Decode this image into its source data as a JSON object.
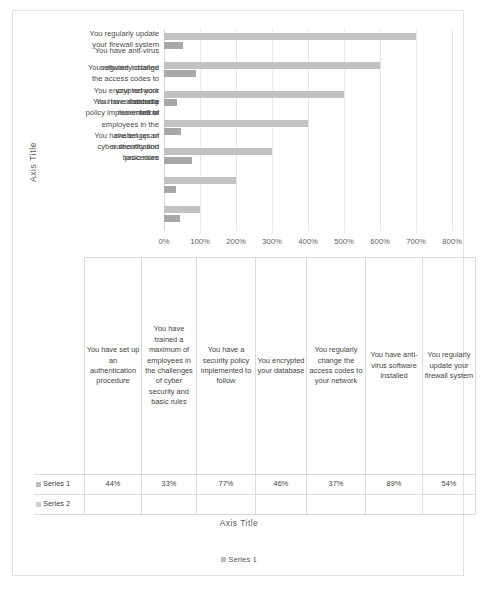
{
  "chart_data": {
    "type": "bar",
    "title": "",
    "orientation": "horizontal",
    "xlabel": "Axis Title",
    "ylabel": "Axis Title",
    "xlim": [
      0,
      800
    ],
    "xunit": "%",
    "grid": true,
    "legend_position": "bottom",
    "legend_entries": [
      "Series 1"
    ],
    "xticks": [
      "0%",
      "100%",
      "200%",
      "300%",
      "400%",
      "500%",
      "600%",
      "700%",
      "800%"
    ],
    "xtick_values": [
      0,
      100,
      200,
      300,
      400,
      500,
      600,
      700,
      800
    ],
    "categories": [
      "You have set up an authentication procedure",
      "You have trained a maximum of employees in the challenges of cyber security and basic rules",
      "You have a security policy implemented to follow",
      "You encrypted your database",
      "You regularly change the access codes to your network",
      "You have anti-virus software installed",
      "You regularly update your firewall system"
    ],
    "series": [
      {
        "name": "Series 1",
        "color": "#c2c2c2",
        "values": [
          100,
          200,
          300,
          400,
          500,
          600,
          700
        ]
      },
      {
        "name": "Series 2",
        "color": "#a8a8a8",
        "values": [
          44,
          33,
          77,
          46,
          37,
          89,
          54
        ]
      }
    ],
    "plot_order_top_to_bottom": [
      "You regularly update your firewall system",
      "You have anti-virus software installed",
      "You regularly change the access codes to your network",
      "You encrypted your database",
      "You have a security policy implemented to follow",
      "You have trained a maximum of employees in the challenges of cyber security and basic rules",
      "You have set up an authentication procedure"
    ],
    "colors": {
      "series1": "#c2c2c2",
      "series2": "#a8a8a8",
      "gridline": "#e8e8e8",
      "border": "#e2e2e2",
      "text": "#3f3f3f"
    }
  },
  "axis_titles": {
    "vertical": "Axis Title",
    "horizontal": "Axis Title"
  },
  "category_labels_rendered": [
    {
      "text": "You regularly update",
      "top": 0,
      "cls": ""
    },
    {
      "text": "your firewall system",
      "top": 11,
      "cls": ""
    },
    {
      "text": "You have anti-virus",
      "top": 17,
      "cls": ""
    },
    {
      "text": "You regularly change",
      "top": 34,
      "cls": ""
    },
    {
      "text": "software installed",
      "top": 34,
      "cls": ""
    },
    {
      "text": "the access codes to",
      "top": 45,
      "cls": ""
    },
    {
      "text": "your network",
      "top": 57,
      "cls": ""
    },
    {
      "text": "You encrypted your",
      "top": 57,
      "cls": ""
    },
    {
      "text": "database",
      "top": 68,
      "cls": ""
    },
    {
      "text": "You have a security",
      "top": 68,
      "cls": ""
    },
    {
      "text": "policy implemented to",
      "top": 79,
      "cls": ""
    },
    {
      "text": "follow",
      "top": 79,
      "cls": ""
    },
    {
      "text": "You have trained a",
      "top": 68,
      "cls": ""
    },
    {
      "text": "maximum of",
      "top": 79,
      "cls": ""
    },
    {
      "text": "employees in the",
      "top": 91,
      "cls": ""
    },
    {
      "text": "challenges of",
      "top": 102,
      "cls": ""
    },
    {
      "text": "cyber security and",
      "top": 113,
      "cls": ""
    },
    {
      "text": "basic rules",
      "top": 124,
      "cls": ""
    },
    {
      "text": "You have set up an",
      "top": 102,
      "cls": ""
    },
    {
      "text": "authentication",
      "top": 113,
      "cls": ""
    },
    {
      "text": "procedure",
      "top": 124,
      "cls": ""
    }
  ],
  "table": {
    "columns": [
      "You have set up an authentication procedure",
      "You have trained a maximum of employees in the challenges of cyber security and basic rules",
      "You have a security policy implemented to follow",
      "You encrypted your database",
      "You regularly change the access codes to your network",
      "You have anti-virus software installed",
      "You regularly update your firewall system"
    ],
    "rows": [
      {
        "label": "Series 1",
        "swatch": "series1-swatch",
        "values": [
          "44%",
          "33%",
          "77%",
          "46%",
          "37%",
          "89%",
          "54%"
        ]
      },
      {
        "label": "Series 2",
        "swatch": "series2-swatch",
        "values": [
          "",
          "",
          "",
          "",
          "",
          "",
          ""
        ]
      }
    ]
  },
  "legend": {
    "entries": [
      {
        "label": "Series 1",
        "swatch": "series1-swatch"
      }
    ]
  }
}
